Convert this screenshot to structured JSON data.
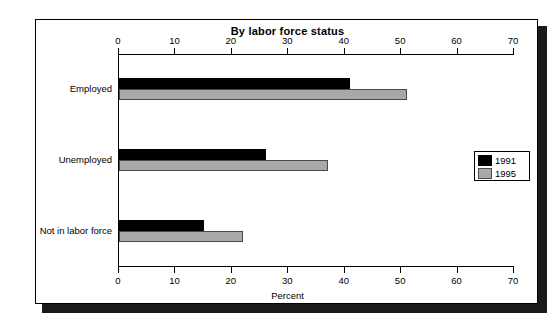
{
  "chart_data": {
    "type": "bar",
    "orientation": "horizontal",
    "title": "By labor force status",
    "xlabel": "Percent",
    "ylabel": "",
    "categories": [
      "Employed",
      "Unemployed",
      "Not in labor force"
    ],
    "series": [
      {
        "name": "1991",
        "color": "#000000",
        "values": [
          41,
          26,
          15
        ]
      },
      {
        "name": "1995",
        "color": "#a8a8a8",
        "values": [
          51,
          37,
          22
        ]
      }
    ],
    "xlim": [
      0,
      70
    ],
    "xticks": [
      0,
      10,
      20,
      30,
      40,
      50,
      60,
      70
    ],
    "xtick_labels": [
      "0",
      "10",
      "20",
      "30",
      "40",
      "50",
      "60",
      "70"
    ],
    "grid": false,
    "axis_top": true,
    "axis_bottom": true,
    "legend_position": "right-middle",
    "legend_entries": [
      "1991",
      "1995"
    ]
  },
  "legend": {
    "entries": [
      {
        "label": "1991"
      },
      {
        "label": "1995"
      }
    ]
  }
}
